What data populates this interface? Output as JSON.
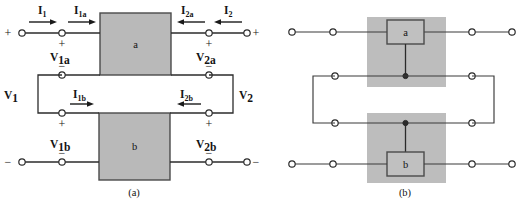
{
  "figure": {
    "width": 522,
    "height": 205,
    "background": "#ffffff",
    "ink_color": "#1a1a1a",
    "block_fill": "#b9b9b9",
    "shade_fill": "#bdbdbd"
  },
  "panel_a": {
    "caption": "(a)",
    "blocks": [
      {
        "id": "block-a",
        "label": "a"
      },
      {
        "id": "block-b",
        "label": "b"
      }
    ],
    "current_labels": [
      {
        "id": "I1",
        "base": "I",
        "sub": "1",
        "direction": "right"
      },
      {
        "id": "I1a",
        "base": "I",
        "sub": "1a",
        "direction": "right"
      },
      {
        "id": "I2a",
        "base": "I",
        "sub": "2a",
        "direction": "left"
      },
      {
        "id": "I2",
        "base": "I",
        "sub": "2",
        "direction": "left"
      },
      {
        "id": "I1b",
        "base": "I",
        "sub": "1b",
        "direction": "right"
      },
      {
        "id": "I2b",
        "base": "I",
        "sub": "2b",
        "direction": "left"
      }
    ],
    "voltage_labels": [
      {
        "id": "V1",
        "base": "V",
        "sub": "1"
      },
      {
        "id": "V2",
        "base": "V",
        "sub": "2"
      },
      {
        "id": "V1a",
        "base": "V",
        "sub": "1a"
      },
      {
        "id": "V2a",
        "base": "V",
        "sub": "2a"
      },
      {
        "id": "V1b",
        "base": "V",
        "sub": "1b"
      },
      {
        "id": "V2b",
        "base": "V",
        "sub": "2b"
      }
    ],
    "polarity_signs": {
      "plus": "+",
      "minus": "−",
      "outer_top_left": "+",
      "outer_top_right": "+",
      "outer_bottom_left": "−",
      "outer_bottom_right": "−"
    }
  },
  "panel_b": {
    "caption": "(b)",
    "blocks": [
      {
        "id": "block-a",
        "label": "a"
      },
      {
        "id": "block-b",
        "label": "b"
      }
    ],
    "shaded_regions": 2,
    "terminals": 12,
    "junction_dots": 2
  }
}
